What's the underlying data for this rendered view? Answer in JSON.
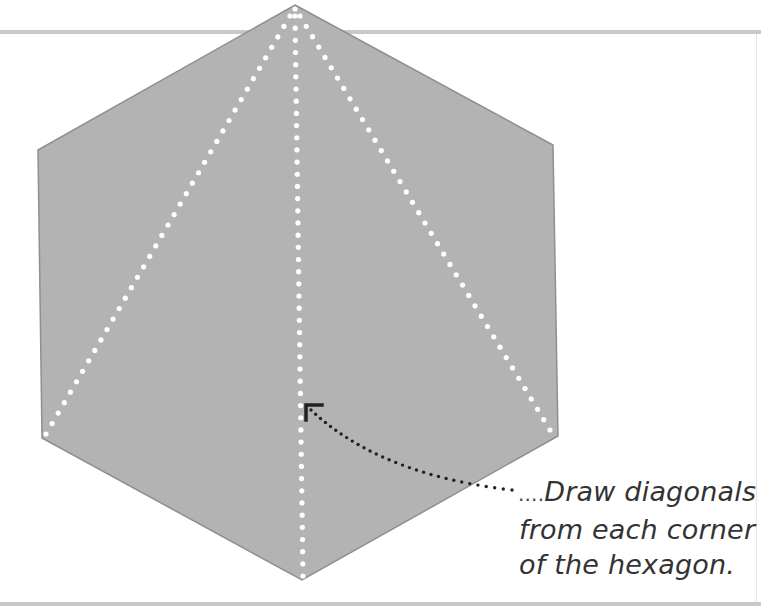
{
  "figure": {
    "shape": "hexagon",
    "fill_color": "#b3b3b3",
    "edge_color": "#8f8f8f",
    "diagonal_color": "#ffffff",
    "diagonal_style": "dotted",
    "diagonals_from_vertex": "top",
    "diagonal_targets": [
      "lower-left",
      "bottom",
      "lower-right"
    ],
    "pointer_color": "#222222",
    "pointer_style": "dotted curved arrow"
  },
  "caption": {
    "lines": [
      "Draw diagonals",
      "from each corner",
      "of the hexagon."
    ],
    "leader": "...."
  },
  "frame_color": "#c8c8c8"
}
